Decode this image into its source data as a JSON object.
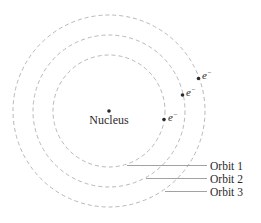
{
  "diagram": {
    "nucleus": {
      "label": "Nucleus",
      "cx": 109,
      "cy": 111
    },
    "orbits": [
      {
        "label": "Orbit 1",
        "radius": 56,
        "electron_label": "e",
        "electron_charge": "−"
      },
      {
        "label": "Orbit 2",
        "radius": 76,
        "electron_label": "e",
        "electron_charge": "−"
      },
      {
        "label": "Orbit 3",
        "radius": 96,
        "electron_label": "e",
        "electron_charge": "−"
      }
    ],
    "colors": {
      "orbit": "#b8b8b8",
      "text": "#2a2a2a",
      "dot": "#2a2a2a"
    }
  }
}
